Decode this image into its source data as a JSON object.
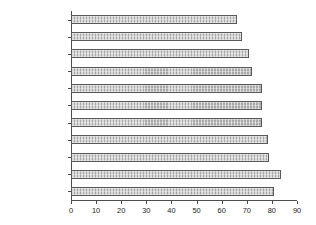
{
  "chart_data": {
    "type": "bar",
    "orientation": "horizontal",
    "title": "",
    "xlabel": "",
    "ylabel": "",
    "xlim": [
      0,
      90
    ],
    "xticks": [
      0,
      10,
      20,
      30,
      40,
      50,
      60,
      70,
      80,
      90
    ],
    "grid": false,
    "legend": false,
    "categories": [
      "Inner London",
      "Main Mets",
      "Large Cities",
      "Other Mets",
      "Industrial",
      "Outer London",
      "Small Cities",
      "New Towns",
      "Resort/retirement",
      "Mixed urban/rural",
      "Remote rural"
    ],
    "values": [
      66,
      68,
      71,
      72,
      76,
      76,
      76,
      78.5,
      79,
      83.5,
      81
    ],
    "bar_color": "#a8a8a8",
    "bar_edge_color": "#595959",
    "axis_color": "#4d4d4d",
    "text_color": "#1a1a1a"
  }
}
